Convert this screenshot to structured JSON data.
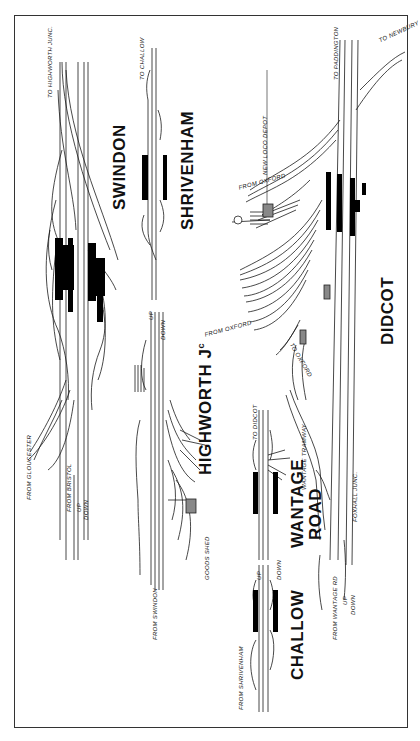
{
  "stations": {
    "swindon": "SWINDON",
    "shrivenham": "SHRIVENHAM",
    "highworth": "HIGHWORTH J",
    "highworth_suffix": "c",
    "didcot": "DIDCOT",
    "wantage_line1": "WANTAGE",
    "wantage_line2": "ROAD",
    "challow": "CHALLOW"
  },
  "labels": {
    "to_highworth_junc": "TO HIGHWORTH JUNC.",
    "to_challow": "TO CHALLOW",
    "from_gloucester": "FROM GLOUCESTER",
    "from_bristol": "FROM BRISTOL",
    "up": "UP",
    "down": "DOWN",
    "from_swindon": "FROM SWINDON",
    "goods_shed": "GOODS SHED",
    "to_didcot": "TO DIDCOT",
    "wantage_tramway": "WANTAGE TRAMWAY",
    "from_shrivenham": "FROM SHRIVENHAM",
    "to_paddington": "TO PADDINGTON",
    "to_newbury": "TO NEWBURY",
    "new_loco_depot": "NEW LOCO DEPOT",
    "from_oxford_1": "FROM OXFORD",
    "from_oxford_2": "FROM OXFORD",
    "to_oxford": "TO OXFORD",
    "from_wantage_rd": "FROM WANTAGE RD",
    "foxhall_junc": "FOXHALL JUNC."
  },
  "colors": {
    "line": "#1a1a1a",
    "platform": "#000000",
    "frame": "#333333",
    "background": "#ffffff"
  }
}
